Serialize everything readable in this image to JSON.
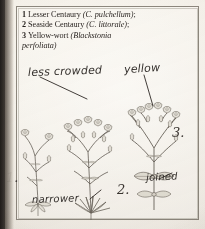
{
  "page": {
    "kind": "scanned-field-guide-plate",
    "background_hex": "#f4f1ec",
    "ink_hex": "#241f1c",
    "pencil_hex": "#35312e",
    "gutter_hex": "#2f2b28"
  },
  "caption": {
    "entries": [
      {
        "number": "1",
        "common_name": "Lesser Centaury",
        "scientific_name": "(C. pulchellum)",
        "terminator": ";"
      },
      {
        "number": "2",
        "common_name": "Seaside Centaury",
        "scientific_name": "(C. littorale)",
        "terminator": ";"
      },
      {
        "number": "3",
        "common_name": "Yellow-wort",
        "scientific_name": "(Blackstonia perfoliata)",
        "terminator": ""
      }
    ],
    "line1": "1 Lesser Centaury (C. pulchellum);",
    "line2": "2 Seaside Centaury (C. littorale);",
    "line3": "3 Yellow-wort (Blackstonia",
    "line4": "perfoliata)"
  },
  "annotations": {
    "less_crowded": "less crowded",
    "yellow": "yellow",
    "joined": "joined",
    "narrower": "narrower"
  },
  "plant_labels": {
    "one": "1.",
    "two": "2.",
    "three": "3."
  },
  "illustrations": [
    {
      "id": "plant-1",
      "label": "1.",
      "name": "Lesser Centaury",
      "note": "less crowded"
    },
    {
      "id": "plant-2",
      "label": "2.",
      "name": "Seaside Centaury",
      "note": "narrower"
    },
    {
      "id": "plant-3",
      "label": "3.",
      "name": "Yellow-wort",
      "note": "yellow / joined"
    }
  ]
}
